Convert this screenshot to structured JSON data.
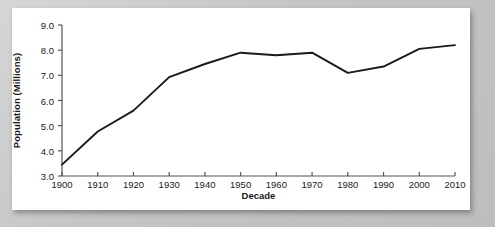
{
  "figure": {
    "background_color": "#c9c9c9",
    "card_color": "#ffffff",
    "line_color": "#1a1a1a",
    "axis_color": "#555555"
  },
  "chart_data": {
    "type": "line",
    "title": "",
    "xlabel": "Decade",
    "ylabel": "Population (Millions)",
    "x": [
      1900,
      1910,
      1920,
      1930,
      1940,
      1950,
      1960,
      1970,
      1980,
      1990,
      2000,
      2010
    ],
    "categories": [
      "1900",
      "1910",
      "1920",
      "1930",
      "1940",
      "1950",
      "1960",
      "1970",
      "1980",
      "1990",
      "2000",
      "2010"
    ],
    "values": [
      3.45,
      4.77,
      5.6,
      6.93,
      7.45,
      7.9,
      7.8,
      7.9,
      7.1,
      7.35,
      8.05,
      8.2
    ],
    "series": [
      {
        "name": "Population",
        "values": [
          3.45,
          4.77,
          5.6,
          6.93,
          7.45,
          7.9,
          7.8,
          7.9,
          7.1,
          7.35,
          8.05,
          8.2
        ]
      }
    ],
    "xlim": [
      1900,
      2010
    ],
    "ylim": [
      3.0,
      9.0
    ],
    "ytick_values": [
      3.0,
      4.0,
      5.0,
      6.0,
      7.0,
      8.0,
      9.0
    ],
    "ytick_labels": [
      "3.0",
      "4.0",
      "5.0",
      "6.0",
      "7.0",
      "8.0",
      "9.0"
    ],
    "xtick_labels": [
      "1900",
      "1910",
      "1920",
      "1930",
      "1940",
      "1950",
      "1960",
      "1970",
      "1980",
      "1990",
      "2000",
      "2010"
    ],
    "grid": false,
    "legend": null,
    "legend_position": "none",
    "annotations": []
  }
}
